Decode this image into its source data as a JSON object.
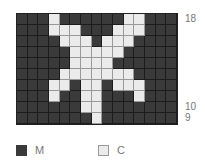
{
  "chart_data": {
    "type": "table",
    "columns": 15,
    "rows": [
      18,
      17,
      16,
      15,
      14,
      13,
      12,
      11,
      10,
      9
    ],
    "row_labels_shown": [
      {
        "row": 18,
        "label": "18"
      },
      {
        "row": 10,
        "label": "10"
      },
      {
        "row": 9,
        "label": "9"
      }
    ],
    "grid": {
      "18": "MMMCMMMMMMCCMMM",
      "17": "MMMCCCMMMCCCMMM",
      "16": "MMMMCCCMCCCMMMM",
      "15": "MMMMMCCCCCMMMMM",
      "14": "MMMMMCCCCMMMMMM",
      "13": "MMMMCCCCCCCMMMM",
      "12": "MMMCCMCCMCCCMMM",
      "11": "MMMCMMCCMMMCMMM",
      "10": "MMMMMMCCMMMMMMM",
      "9": "MMMMMMMCMMMMMMM"
    },
    "legend": [
      {
        "key": "M",
        "label": "M",
        "color": "#3a3a3a"
      },
      {
        "key": "C",
        "label": "C",
        "color": "#ebebeb"
      }
    ]
  },
  "labels": {
    "r18": "18",
    "r10": "10",
    "r9": "9"
  },
  "legend": {
    "m_label": "M",
    "c_label": "C"
  }
}
